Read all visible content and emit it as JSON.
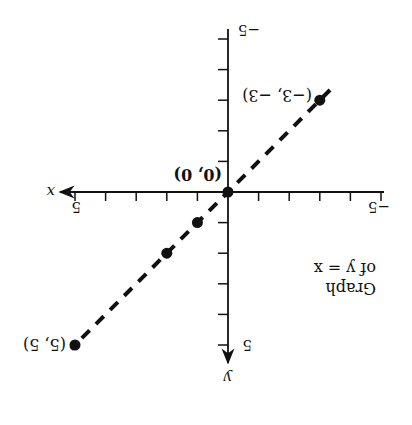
{
  "chart_data": {
    "type": "scatter",
    "title": "Graph of y = x",
    "title_lines": [
      "Graph",
      "of y = x"
    ],
    "xlabel": "x",
    "ylabel": "y",
    "xlim": [
      -5,
      5
    ],
    "ylim": [
      -5,
      5
    ],
    "x_tick_labels": [
      "-5",
      "5"
    ],
    "y_tick_labels": [
      "-5",
      "5"
    ],
    "grid": false,
    "orientation": "rotated 180 degrees",
    "series": [
      {
        "name": "y = x",
        "line_style": "dashed",
        "points": [
          {
            "x": -3,
            "y": -3,
            "label": "(−3, −3)"
          },
          {
            "x": 0,
            "y": 0,
            "label": "(0, 0)"
          },
          {
            "x": 1,
            "y": 1,
            "label": ""
          },
          {
            "x": 2,
            "y": 2,
            "label": ""
          },
          {
            "x": 5,
            "y": 5,
            "label": "(5, 5)"
          }
        ],
        "x": [
          -3,
          0,
          1,
          2,
          5
        ],
        "y": [
          -3,
          0,
          1,
          2,
          5
        ]
      }
    ]
  },
  "labels": {
    "x_axis": "x",
    "y_axis": "y",
    "x_neg": "−5",
    "x_pos": "5",
    "y_neg": "−5",
    "y_pos": "5",
    "p_neg3": "(−3, −3)",
    "p_origin": "(0, 0)",
    "p_5": "(5, 5)",
    "title1": "Graph",
    "title2": "of y = x"
  }
}
